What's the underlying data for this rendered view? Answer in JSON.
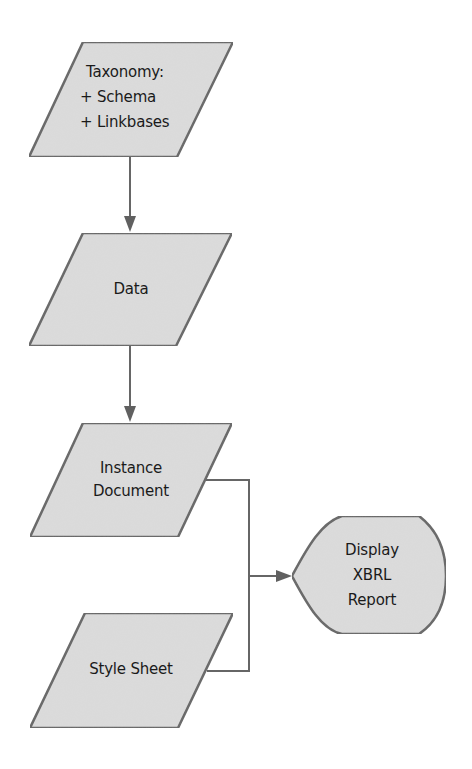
{
  "diagram": {
    "type": "flowchart",
    "colors": {
      "shape_fill": "#dcdcdc",
      "stroke": "#666666",
      "text": "#1a1a1a",
      "background": "#ffffff"
    },
    "nodes": [
      {
        "id": "taxonomy",
        "shape": "parallelogram",
        "lines": [
          "Taxonomy:",
          "+ Schema",
          "+ Linkbases"
        ]
      },
      {
        "id": "data",
        "shape": "parallelogram",
        "lines": [
          "Data"
        ]
      },
      {
        "id": "instance-document",
        "shape": "parallelogram",
        "lines": [
          "Instance",
          "Document"
        ]
      },
      {
        "id": "style-sheet",
        "shape": "parallelogram",
        "lines": [
          "Style Sheet"
        ]
      },
      {
        "id": "display-xbrl-report",
        "shape": "display",
        "lines": [
          "Display",
          "XBRL",
          "Report"
        ]
      }
    ],
    "edges": [
      {
        "from": "taxonomy",
        "to": "data"
      },
      {
        "from": "data",
        "to": "instance-document"
      },
      {
        "from": "instance-document",
        "to": "display-xbrl-report"
      },
      {
        "from": "style-sheet",
        "to": "display-xbrl-report"
      }
    ]
  }
}
